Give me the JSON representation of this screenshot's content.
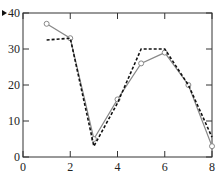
{
  "chart_data": {
    "type": "line",
    "title": "",
    "xlabel": "",
    "ylabel": "",
    "xlim": [
      0,
      8
    ],
    "ylim": [
      0,
      40
    ],
    "xticks": [
      0,
      2,
      4,
      6,
      8
    ],
    "yticks": [
      0,
      10,
      20,
      30,
      40
    ],
    "grid": false,
    "legend": null,
    "series": [
      {
        "name": "solid-circles",
        "style": "solid",
        "marker": "circle",
        "color": "#888888",
        "x": [
          1,
          2,
          3,
          4,
          5,
          6,
          7,
          8
        ],
        "y": [
          37,
          33,
          5,
          16,
          26,
          29,
          20,
          3
        ]
      },
      {
        "name": "dashed",
        "style": "dashed",
        "marker": "none",
        "color": "#111111",
        "x": [
          1,
          2,
          3,
          4,
          5,
          6,
          7,
          8
        ],
        "y": [
          32.5,
          33,
          3,
          15,
          30,
          30,
          20,
          5.5
        ]
      }
    ]
  },
  "axis": {
    "x_tick_labels": [
      "0",
      "2",
      "4",
      "6",
      "8"
    ],
    "y_tick_labels": [
      "0",
      "10",
      "20",
      "30",
      "40"
    ]
  }
}
